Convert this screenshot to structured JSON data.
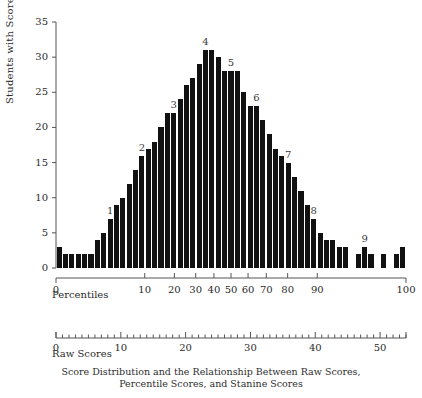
{
  "caption": {
    "line1": "Score Distribution and the Relationship Between Raw Scores,",
    "line2": "Percentile Scores, and Stanine Scores"
  },
  "chart_data": {
    "type": "bar",
    "xlabel": "Percentiles",
    "ylabel": "Students with Score",
    "ylim": [
      0,
      35
    ],
    "yticks": [
      0,
      5,
      10,
      15,
      20,
      25,
      30,
      35
    ],
    "grid": false,
    "legend": "none",
    "x": [
      0,
      1,
      2,
      3,
      4,
      5,
      6,
      7,
      8,
      9,
      10,
      11,
      12,
      13,
      14,
      15,
      16,
      17,
      18,
      19,
      20,
      21,
      22,
      23,
      24,
      25,
      26,
      27,
      28,
      29,
      30,
      31,
      32,
      33,
      34,
      35,
      36,
      37,
      38,
      39,
      40,
      41,
      42,
      43,
      44,
      45,
      46,
      47,
      48,
      49,
      50,
      51,
      52,
      53,
      54
    ],
    "values": [
      3,
      2,
      2,
      2,
      2,
      2,
      4,
      5,
      7,
      9,
      10,
      12,
      14,
      16,
      17,
      18,
      20,
      22,
      22,
      24,
      26,
      27,
      29,
      31,
      31,
      30,
      28,
      28,
      28,
      25,
      23,
      23,
      21,
      19,
      17,
      16,
      15,
      13,
      11,
      9,
      7,
      5,
      4,
      4,
      3,
      3,
      0,
      2,
      3,
      2,
      0,
      2,
      0,
      2,
      3
    ],
    "bar_color": "#111111",
    "axes": [
      {
        "name": "Percentiles",
        "position": "below-plot",
        "scale": "normal-probability",
        "ticks": [
          0,
          10,
          20,
          30,
          40,
          50,
          60,
          70,
          80,
          90,
          100
        ],
        "tick_labels": [
          "0",
          "10",
          "20",
          "30",
          "40",
          "50",
          "60",
          "70",
          "80",
          "90",
          "100"
        ]
      },
      {
        "name": "Raw Scores",
        "position": "detached-below",
        "scale": "linear",
        "range": [
          0,
          54
        ],
        "major_ticks": [
          0,
          10,
          20,
          30,
          40,
          50
        ],
        "major_tick_labels": [
          "0",
          "10",
          "20",
          "30",
          "40",
          "50"
        ],
        "minor_tick_step": 1
      }
    ],
    "stanine_annotations": [
      {
        "label": "1",
        "raw_score": 8,
        "value": 7
      },
      {
        "label": "2",
        "raw_score": 13,
        "value": 16
      },
      {
        "label": "3",
        "raw_score": 18,
        "value": 22
      },
      {
        "label": "4",
        "raw_score": 23,
        "value": 31
      },
      {
        "label": "5",
        "raw_score": 27,
        "value": 28
      },
      {
        "label": "6",
        "raw_score": 31,
        "value": 23
      },
      {
        "label": "7",
        "raw_score": 36,
        "value": 15
      },
      {
        "label": "8",
        "raw_score": 40,
        "value": 7
      },
      {
        "label": "9",
        "raw_score": 48,
        "value": 3
      }
    ]
  }
}
